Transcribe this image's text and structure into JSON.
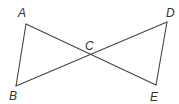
{
  "diagram": {
    "type": "geometry",
    "points": {
      "A": {
        "label": "A",
        "x": 26,
        "y": 24,
        "lx": 18,
        "ly": 17
      },
      "B": {
        "label": "B",
        "x": 16,
        "y": 86,
        "lx": 9,
        "ly": 100
      },
      "C": {
        "label": "C",
        "x": 90,
        "y": 55,
        "lx": 85,
        "ly": 50
      },
      "D": {
        "label": "D",
        "x": 167,
        "y": 22,
        "lx": 166,
        "ly": 17
      },
      "E": {
        "label": "E",
        "x": 156,
        "y": 85,
        "lx": 150,
        "ly": 101
      }
    },
    "segments": [
      [
        "A",
        "E"
      ],
      [
        "B",
        "D"
      ],
      [
        "A",
        "B"
      ],
      [
        "D",
        "E"
      ]
    ],
    "colors": {
      "stroke": "#444444",
      "label": "#333333"
    }
  }
}
